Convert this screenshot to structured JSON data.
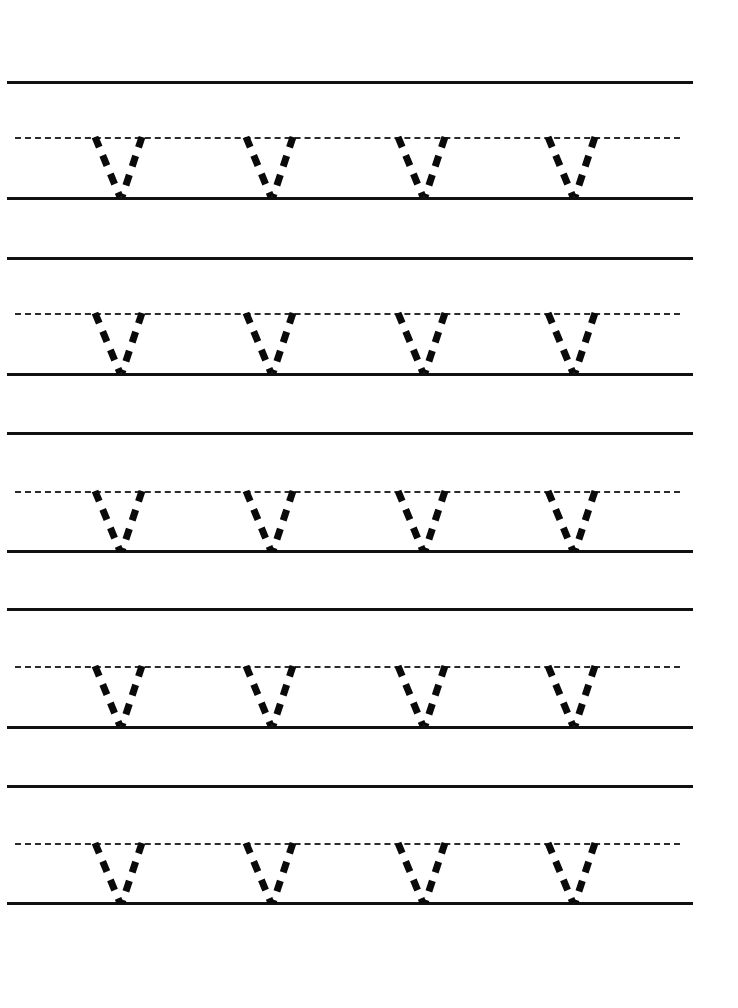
{
  "worksheet": {
    "title": "Letter V Tracing Practice Worksheet",
    "letter": "V",
    "page_background": "#ffffff",
    "ink_color": "#0a0a0a",
    "guide_line_color": "#111111",
    "dashed_guide_color": "#2b2b2b",
    "page_width": 738,
    "page_height": 1008,
    "rows_count": 5,
    "letters_per_row": 4,
    "letter_style": "dashed-trace-outline"
  },
  "guides": {
    "solid_line_start_x": 7,
    "solid_line_end_x": 693,
    "dashed_line_start_x": 15,
    "dashed_line_end_x": 680,
    "solid_thickness": 3,
    "dashed_thickness": 2,
    "dash_length": 16,
    "dash_gap": 8,
    "row_period": 176,
    "midline_offset": 56,
    "baseline_offset": 116
  },
  "rows": [
    {
      "index": 1,
      "top_line_y": 81,
      "mid_line_y": 137,
      "base_line_y": 197,
      "letters": [
        {
          "label": "V",
          "left_x": 95
        },
        {
          "label": "V",
          "left_x": 246
        },
        {
          "label": "V",
          "left_x": 398
        },
        {
          "label": "V",
          "left_x": 548
        }
      ]
    },
    {
      "index": 2,
      "top_line_y": 257,
      "mid_line_y": 313,
      "base_line_y": 373,
      "letters": [
        {
          "label": "V",
          "left_x": 95
        },
        {
          "label": "V",
          "left_x": 246
        },
        {
          "label": "V",
          "left_x": 398
        },
        {
          "label": "V",
          "left_x": 548
        }
      ]
    },
    {
      "index": 3,
      "top_line_y": 432,
      "mid_line_y": 491,
      "base_line_y": 550,
      "letters": [
        {
          "label": "V",
          "left_x": 95
        },
        {
          "label": "V",
          "left_x": 246
        },
        {
          "label": "V",
          "left_x": 398
        },
        {
          "label": "V",
          "left_x": 548
        }
      ]
    },
    {
      "index": 4,
      "top_line_y": 608,
      "mid_line_y": 666,
      "base_line_y": 726,
      "letters": [
        {
          "label": "V",
          "left_x": 95
        },
        {
          "label": "V",
          "left_x": 246
        },
        {
          "label": "V",
          "left_x": 398
        },
        {
          "label": "V",
          "left_x": 548
        }
      ]
    },
    {
      "index": 5,
      "top_line_y": 785,
      "mid_line_y": 843,
      "base_line_y": 902,
      "letters": [
        {
          "label": "V",
          "left_x": 95
        },
        {
          "label": "V",
          "left_x": 246
        },
        {
          "label": "V",
          "left_x": 398
        },
        {
          "label": "V",
          "left_x": 548
        }
      ]
    }
  ],
  "letter_glyph": {
    "name": "V",
    "width": 47,
    "height": 60,
    "apex_offset_x": 25,
    "stroke_width": 7,
    "dash_pattern": "11 9",
    "strokes": [
      {
        "name": "left-diagonal-down-right",
        "x1": 0,
        "y1": 0,
        "x2": 25,
        "y2": 60
      },
      {
        "name": "right-diagonal-down-left",
        "x1": 47,
        "y1": 0,
        "x2": 27,
        "y2": 60
      }
    ]
  }
}
